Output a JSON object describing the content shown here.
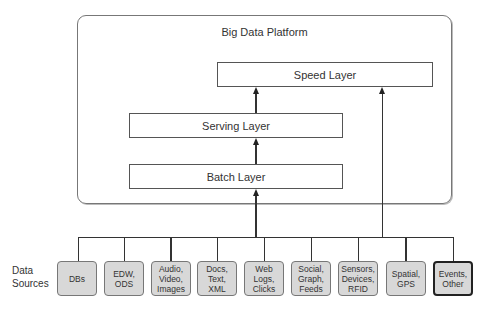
{
  "diagram": {
    "platform_title": "Big Data Platform",
    "layers": {
      "speed": "Speed Layer",
      "serving": "Serving Layer",
      "batch": "Batch Layer"
    },
    "sources_label": "Data\nSources",
    "sources": [
      {
        "label": "DBs"
      },
      {
        "label": "EDW,\nODS"
      },
      {
        "label": "Audio,\nVideo,\nImages"
      },
      {
        "label": "Docs,\nText,\nXML"
      },
      {
        "label": "Web\nLogs,\nClicks"
      },
      {
        "label": "Social,\nGraph,\nFeeds"
      },
      {
        "label": "Sensors,\nDevices,\nRFID"
      },
      {
        "label": "Spatial,\nGPS"
      },
      {
        "label": "Events,\nOther"
      }
    ],
    "colors": {
      "source_fill": "#d8d8d8",
      "line": "#333333",
      "highlight_border": "#222222"
    }
  }
}
